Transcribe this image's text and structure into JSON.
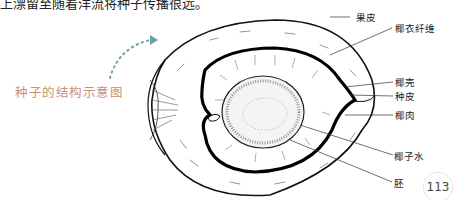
{
  "top_text": "上漂留至随着洋流将种子传播很远。",
  "caption": "种子的结构示意图",
  "labels": {
    "pericarp": "果皮",
    "coir_fiber": "椰衣纤维",
    "shell": "椰壳",
    "seed_coat": "种皮",
    "flesh": "椰肉",
    "coconut_water": "椰子水",
    "embryo": "胚"
  },
  "page_number": "113",
  "colors": {
    "caption": "#c98f6e",
    "arrow": "#6aa3a3",
    "page_circle": "#e3b9b3"
  }
}
